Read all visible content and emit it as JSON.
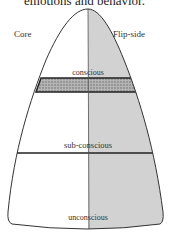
{
  "caption": "emotions and behavior.",
  "diagram": {
    "left_label": "Core",
    "right_label": "Flip-side",
    "levels": [
      {
        "label": "conscious"
      },
      {
        "label": "sub-conscious"
      },
      {
        "label": "unconscious"
      }
    ],
    "colors": {
      "outline": "#333333",
      "flip_side_fill": "#d0d0d0",
      "band_fill": "#9a9a9a"
    }
  }
}
